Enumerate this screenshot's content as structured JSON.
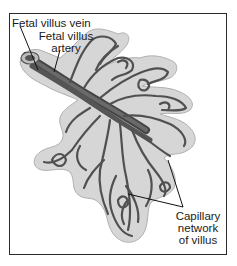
{
  "figure": {
    "labels": {
      "vein": "Fetal villus vein",
      "artery_line1": "Fetal villus",
      "artery_line2": "artery",
      "capillary_line1": "Capillary",
      "capillary_line2": "network",
      "capillary_line3": "of villus"
    },
    "colors": {
      "villus_fill": "#d4d4d4",
      "villus_outline": "#a8a8a8",
      "vessel_dark": "#4a4a4a",
      "vessel_mid": "#6e6e6e",
      "frame": "#2a2a2a",
      "leader_line": "#111111"
    }
  }
}
